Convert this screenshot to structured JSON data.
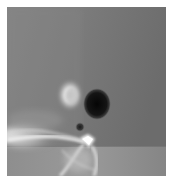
{
  "figure": {
    "kind": "grayscale field map",
    "colors": {
      "background_border": "#ffffff",
      "field_mid": "#7b7b7b",
      "field_dark_right": "#6c6c6c",
      "dark_blob": "#0e0e0e",
      "bright_feature": "#f4f4f4",
      "lower_band": "#8e8e8e"
    },
    "features": [
      {
        "name": "dark-elliptical-blob",
        "cx": 97,
        "cy": 104,
        "rx": 12,
        "ry": 14
      },
      {
        "name": "bright-lobe",
        "cx": 70,
        "cy": 95,
        "rx": 11,
        "ry": 14
      },
      {
        "name": "small-dark-dot",
        "cx": 80,
        "cy": 127,
        "r": 4
      },
      {
        "name": "bright-diamond",
        "cx": 88,
        "cy": 142
      },
      {
        "name": "horizontal-discontinuity",
        "y": 146
      }
    ]
  }
}
